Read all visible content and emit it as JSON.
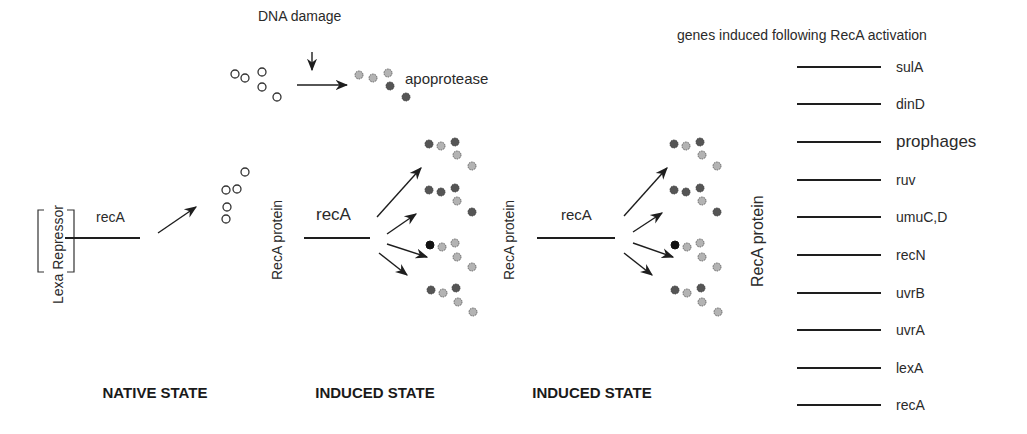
{
  "labels": {
    "dna_damage": "DNA damage",
    "apoprotease": "apoprotease",
    "lexa_repressor": "Lexa Repressor",
    "reca_gene_native": "recA",
    "reca_gene_induced_1": "recA",
    "reca_gene_induced_2": "recA",
    "reca_protein_1": "RecA protein",
    "reca_protein_2": "RecA protein",
    "reca_protein_3": "RecA protein",
    "genes_header": "genes induced following RecA activation"
  },
  "states": [
    {
      "label": "NATIVE STATE",
      "x": 155
    },
    {
      "label": "INDUCED STATE",
      "x": 375
    },
    {
      "label": "INDUCED STATE",
      "x": 592
    }
  ],
  "genes": [
    {
      "label": "sulA",
      "y": 67,
      "emphasis": false
    },
    {
      "label": "dinD",
      "y": 104,
      "emphasis": false
    },
    {
      "label": "prophages",
      "y": 142,
      "emphasis": true
    },
    {
      "label": "ruv",
      "y": 180,
      "emphasis": false
    },
    {
      "label": "umuC,D",
      "y": 217,
      "emphasis": false
    },
    {
      "label": "recN",
      "y": 255,
      "emphasis": false
    },
    {
      "label": "uvrB",
      "y": 293,
      "emphasis": false
    },
    {
      "label": "uvrA",
      "y": 330,
      "emphasis": false
    },
    {
      "label": "lexA",
      "y": 368,
      "emphasis": false
    },
    {
      "label": "recA",
      "y": 405,
      "emphasis": false
    }
  ],
  "colors": {
    "line": "#1e1e1e",
    "dark_dot": "#555555",
    "light_dot": "#b3b3b3",
    "text": "#2a2a2a"
  }
}
